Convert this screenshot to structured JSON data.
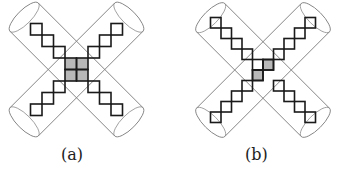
{
  "figure": {
    "panels": [
      {
        "id": "a",
        "label": "(a)",
        "center": [
          76.5,
          69.5
        ],
        "cell": 11.5,
        "arm_half_width": 20,
        "arm_half_length": 74,
        "white_cells": [
          [
            -4,
            -4
          ],
          [
            -3,
            -3
          ],
          [
            -2,
            -2
          ],
          [
            3,
            -4
          ],
          [
            2,
            -3
          ],
          [
            1,
            -2
          ],
          [
            -4,
            3
          ],
          [
            -3,
            2
          ],
          [
            -2,
            1
          ],
          [
            3,
            3
          ],
          [
            2,
            2
          ],
          [
            1,
            1
          ]
        ],
        "gray_cells": [
          [
            -1,
            -1
          ],
          [
            0,
            -1
          ],
          [
            -1,
            0
          ],
          [
            0,
            0
          ]
        ]
      },
      {
        "id": "b",
        "label": "(b)",
        "center": [
          95,
          70
        ],
        "cell": 10.5,
        "arm_half_width": 20,
        "arm_half_length": 74,
        "white_cells": [
          [
            -5,
            -5
          ],
          [
            -4,
            -4
          ],
          [
            -3,
            -3
          ],
          [
            -2,
            -2
          ],
          [
            -1,
            -1
          ],
          [
            4,
            -5
          ],
          [
            3,
            -4
          ],
          [
            2,
            -3
          ],
          [
            1,
            -2
          ],
          [
            -5,
            4
          ],
          [
            -4,
            3
          ],
          [
            -3,
            2
          ],
          [
            -2,
            1
          ],
          [
            4,
            4
          ],
          [
            3,
            3
          ],
          [
            2,
            2
          ],
          [
            1,
            1
          ],
          [
            0,
            -1
          ],
          [
            -1,
            0
          ]
        ],
        "gray_cells": [
          [
            0,
            -1
          ],
          [
            -1,
            0
          ]
        ]
      }
    ],
    "colors": {
      "square_stroke": "#1a1a1a",
      "gray_fill": "#b8b8b8",
      "cylinder_stroke": "#808080",
      "label": "#222222"
    }
  }
}
